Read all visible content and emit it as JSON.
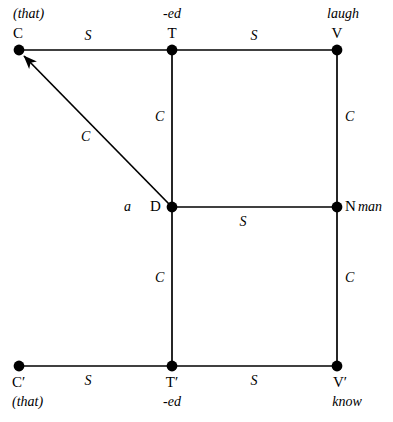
{
  "canvas": {
    "width": 393,
    "height": 422,
    "background": "#ffffff",
    "line_color": "#000000",
    "node_color": "#000000"
  },
  "nodes": [
    {
      "id": "C",
      "label": "C",
      "gloss": "(that)",
      "gloss_position": "above",
      "x": 19,
      "y": 50
    },
    {
      "id": "T",
      "label": "T",
      "gloss": "-ed",
      "gloss_position": "above",
      "x": 172,
      "y": 50
    },
    {
      "id": "V",
      "label": "V",
      "gloss": "laugh",
      "gloss_position": "above",
      "x": 337,
      "y": 50
    },
    {
      "id": "D",
      "label": "D",
      "gloss": "a",
      "gloss_position": "left",
      "x": 172,
      "y": 207
    },
    {
      "id": "N",
      "label": "N",
      "gloss": "man",
      "gloss_position": "right",
      "x": 337,
      "y": 207
    },
    {
      "id": "Cprime",
      "label": "C′",
      "gloss": "(that)",
      "gloss_position": "below",
      "x": 19,
      "y": 366
    },
    {
      "id": "Tprime",
      "label": "T′",
      "gloss": "-ed",
      "gloss_position": "below",
      "x": 172,
      "y": 366
    },
    {
      "id": "Vprime",
      "label": "V′",
      "gloss": "know",
      "gloss_position": "below",
      "x": 337,
      "y": 366
    }
  ],
  "edges": [
    {
      "name": "edge-c-t",
      "from": "C",
      "to": "T",
      "label": "S",
      "arrow": false
    },
    {
      "name": "edge-t-v",
      "from": "T",
      "to": "V",
      "label": "S",
      "arrow": false
    },
    {
      "name": "edge-t-d",
      "from": "T",
      "to": "D",
      "label": "C",
      "arrow": false
    },
    {
      "name": "edge-v-n",
      "from": "V",
      "to": "N",
      "label": "C",
      "arrow": false
    },
    {
      "name": "edge-d-n",
      "from": "D",
      "to": "N",
      "label": "S",
      "arrow": false
    },
    {
      "name": "edge-d-tprime",
      "from": "D",
      "to": "T′",
      "label": "C",
      "arrow": false
    },
    {
      "name": "edge-n-vprime",
      "from": "N",
      "to": "V′",
      "label": "C",
      "arrow": false
    },
    {
      "name": "edge-cprime-tprime",
      "from": "C′",
      "to": "T′",
      "label": "S",
      "arrow": false
    },
    {
      "name": "edge-tprime-vprime",
      "from": "T′",
      "to": "V′",
      "label": "S",
      "arrow": false
    },
    {
      "name": "edge-movement-d-c",
      "from": "D",
      "to": "C",
      "label": "C",
      "arrow": true
    }
  ],
  "edge_labels": {
    "c_t": "S",
    "t_v": "S",
    "t_d": "C",
    "v_n": "C",
    "d_n": "S",
    "d_tprime": "C",
    "n_vprime": "C",
    "cprime_tprime": "S",
    "tprime_vprime": "S",
    "movement": "C"
  },
  "node_labels": {
    "c": "C",
    "t": "T",
    "v": "V",
    "d": "D",
    "n": "N",
    "cprime": "C′",
    "tprime": "T′",
    "vprime": "V′"
  },
  "glosses": {
    "c": "(that)",
    "t": "-ed",
    "v": "laugh",
    "d": "a",
    "n": "man",
    "cprime": "(that)",
    "tprime": "-ed",
    "vprime": "know"
  }
}
